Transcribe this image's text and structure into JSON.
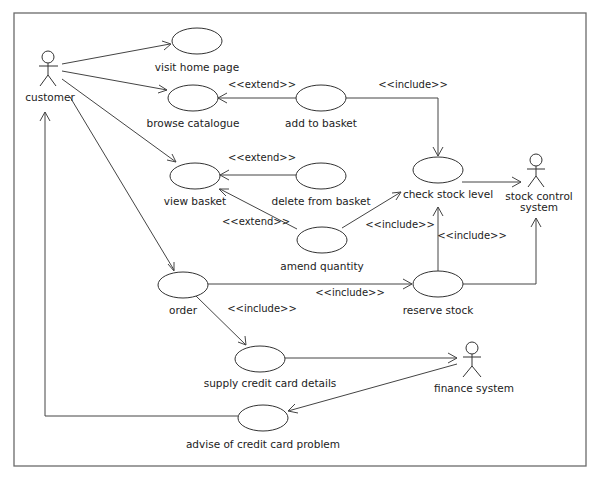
{
  "diagram": {
    "type": "UML use case diagram",
    "actors": [
      {
        "id": "customer",
        "label": "customer"
      },
      {
        "id": "stock_control",
        "label_line1": "stock control",
        "label_line2": "system"
      },
      {
        "id": "finance",
        "label": "finance system"
      }
    ],
    "use_cases": [
      {
        "id": "visit_home",
        "label": "visit home page"
      },
      {
        "id": "browse",
        "label": "browse catalogue"
      },
      {
        "id": "add_basket",
        "label": "add to basket"
      },
      {
        "id": "view_basket",
        "label": "view basket"
      },
      {
        "id": "delete_basket",
        "label": "delete from basket"
      },
      {
        "id": "check_stock",
        "label": "check stock level"
      },
      {
        "id": "amend_qty",
        "label": "amend quantity"
      },
      {
        "id": "order",
        "label": "order"
      },
      {
        "id": "reserve_stock",
        "label": "reserve stock"
      },
      {
        "id": "supply_cc",
        "label": "supply credit card details"
      },
      {
        "id": "advise_cc",
        "label": "advise of credit card problem"
      }
    ],
    "stereotypes": {
      "extend_add": "<<extend>>",
      "extend_delete": "<<extend>>",
      "extend_amend": "<<extend>>",
      "include_add_check": "<<include>>",
      "include_amend_check": "<<include>>",
      "include_reserve_check": "<<include>>",
      "include_order_reserve": "<<include>>",
      "include_order_supply": "<<include>>"
    },
    "relationships": [
      {
        "from": "customer",
        "to": "visit_home",
        "type": "association"
      },
      {
        "from": "customer",
        "to": "browse",
        "type": "association"
      },
      {
        "from": "customer",
        "to": "view_basket",
        "type": "association"
      },
      {
        "from": "customer",
        "to": "order",
        "type": "association"
      },
      {
        "from": "add_basket",
        "to": "browse",
        "type": "extend"
      },
      {
        "from": "delete_basket",
        "to": "view_basket",
        "type": "extend"
      },
      {
        "from": "amend_qty",
        "to": "view_basket",
        "type": "extend"
      },
      {
        "from": "add_basket",
        "to": "check_stock",
        "type": "include"
      },
      {
        "from": "amend_qty",
        "to": "check_stock",
        "type": "include"
      },
      {
        "from": "reserve_stock",
        "to": "check_stock",
        "type": "include"
      },
      {
        "from": "order",
        "to": "reserve_stock",
        "type": "include"
      },
      {
        "from": "order",
        "to": "supply_cc",
        "type": "include"
      },
      {
        "from": "check_stock",
        "to": "stock_control",
        "type": "association"
      },
      {
        "from": "reserve_stock",
        "to": "stock_control",
        "type": "association"
      },
      {
        "from": "supply_cc",
        "to": "finance",
        "type": "association"
      },
      {
        "from": "finance",
        "to": "advise_cc",
        "type": "association"
      },
      {
        "from": "advise_cc",
        "to": "customer",
        "type": "association"
      }
    ]
  }
}
